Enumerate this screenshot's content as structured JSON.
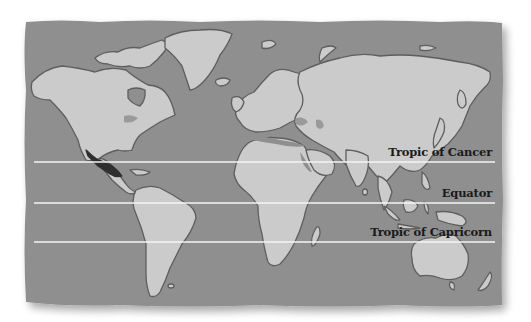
{
  "map": {
    "type": "world map",
    "colors": {
      "ocean": "#8f8f8f",
      "land": "#cbcbcb",
      "coast": "#5e5e5e",
      "highlight_mexico": "#2f2f2f",
      "highlight_inland_water": "#9a9a9a",
      "latitude_line": "#f4f4f4",
      "label_text": "#1a1a1a",
      "background": "#ffffff"
    },
    "highlighted_region": "Mexico",
    "lines": [
      {
        "name": "tropic-of-cancer",
        "label": "Tropic of Cancer",
        "y": 162
      },
      {
        "name": "equator",
        "label": "Equator",
        "y": 203
      },
      {
        "name": "tropic-of-capricorn",
        "label": "Tropic of Capricorn",
        "y": 242
      }
    ]
  }
}
